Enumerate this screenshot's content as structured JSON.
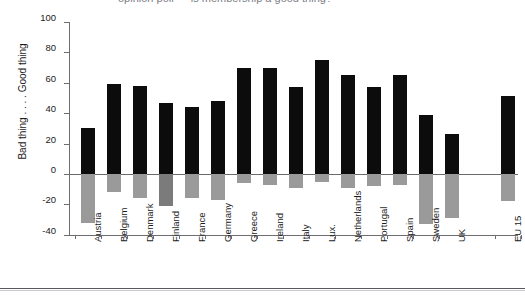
{
  "figure": {
    "title_sliver": "opinion poll — is membership a good thing?",
    "bottom_rule": "figure-rule"
  },
  "chart_data": {
    "type": "bar",
    "title": "",
    "xlabel": "",
    "ylabel": "Bad thing . . . . Good thing",
    "ylim": [
      -40,
      100
    ],
    "yticks": [
      100,
      80,
      60,
      40,
      20,
      0,
      -20,
      -40
    ],
    "ytick_labels": [
      "100",
      "80",
      "60",
      "40",
      "20",
      "0",
      "-20",
      "-40"
    ],
    "grid": false,
    "legend": "none",
    "zero_reference_line": 0,
    "categories": [
      "Austria",
      "Belgium",
      "Denmark",
      "Finland",
      "France",
      "Germany",
      "Greece",
      "Ireland",
      "Italy",
      "Lux.",
      "Netherlands",
      "Portugal",
      "Spain",
      "Sweden",
      "UK",
      "EU 15"
    ],
    "series": [
      {
        "name": "Good thing",
        "color": "#0c0c0c",
        "values": [
          30,
          59,
          58,
          47,
          44,
          48,
          70,
          70,
          57,
          75,
          65,
          57,
          65,
          39,
          26,
          51
        ]
      },
      {
        "name": "Bad thing",
        "color": "#9a9a9a",
        "values": [
          -32,
          -12,
          -16,
          -21,
          -16,
          -17,
          -6,
          -7,
          -9,
          -5,
          -9,
          -8,
          -7,
          -33,
          -29,
          -18
        ]
      }
    ],
    "separated_last_category": "EU 15"
  }
}
